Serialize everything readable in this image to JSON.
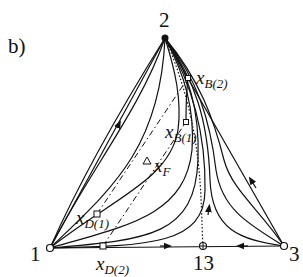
{
  "figure": {
    "panel_label": "b)",
    "type": "ternary residue-curve map"
  },
  "vertices": [
    {
      "id": "1",
      "label": "1",
      "marker": "open-circle"
    },
    {
      "id": "2",
      "label": "2",
      "marker": "filled-circle"
    },
    {
      "id": "3",
      "label": "3",
      "marker": "open-circle"
    }
  ],
  "singular_points": [
    {
      "id": "13",
      "label": "13",
      "marker": "crossed-circle"
    }
  ],
  "composition_points": [
    {
      "id": "xB2",
      "symbol": "x",
      "sub": "B(2)",
      "marker": "small-square-dot"
    },
    {
      "id": "xB1",
      "symbol": "x",
      "sub": "B(1)",
      "marker": "small-square-dot"
    },
    {
      "id": "xF",
      "symbol": "x",
      "sub": "F",
      "marker": "open-triangle"
    },
    {
      "id": "xD1",
      "symbol": "x",
      "sub": "D(1)",
      "marker": "open-square"
    },
    {
      "id": "xD2",
      "symbol": "x",
      "sub": "D(2)",
      "marker": "open-square"
    }
  ],
  "colors": {
    "line": "#111111",
    "background": "#ffffff"
  }
}
